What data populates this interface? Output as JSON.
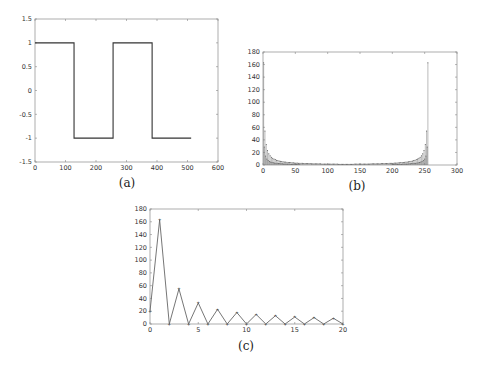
{
  "chart_data": [
    {
      "id": "a",
      "type": "line",
      "caption": "(a)",
      "title": "",
      "xlabel": "",
      "ylabel": "",
      "xlim": [
        0,
        600
      ],
      "ylim": [
        -1.5,
        1.5
      ],
      "xticks": [
        0,
        100,
        200,
        300,
        400,
        500,
        600
      ],
      "yticks": [
        -1.5,
        -1,
        -0.5,
        0,
        0.5,
        1,
        1.5
      ],
      "xtick_labels": [
        "0",
        "100",
        "200",
        "300",
        "400",
        "500",
        "600"
      ],
      "ytick_labels": [
        "-1.5",
        "-1",
        "-0.5",
        "0",
        "0.5",
        "1",
        "1.5"
      ],
      "grid": false,
      "series": [
        {
          "name": "square wave",
          "x": [
            0,
            128,
            128,
            256,
            256,
            384,
            384,
            512
          ],
          "y": [
            1,
            1,
            -1,
            -1,
            1,
            1,
            -1,
            -1
          ]
        }
      ]
    },
    {
      "id": "b",
      "type": "bar",
      "caption": "(b)",
      "title": "",
      "xlabel": "",
      "ylabel": "",
      "xlim": [
        0,
        300
      ],
      "ylim": [
        0,
        180
      ],
      "xticks": [
        0,
        50,
        100,
        150,
        200,
        250,
        300
      ],
      "yticks": [
        0,
        20,
        40,
        60,
        80,
        100,
        120,
        140,
        160,
        180
      ],
      "xtick_labels": [
        "0",
        "50",
        "100",
        "150",
        "200",
        "250",
        "300"
      ],
      "ytick_labels": [
        "0",
        "20",
        "40",
        "60",
        "80",
        "100",
        "120",
        "140",
        "160",
        "180"
      ],
      "grid": false,
      "description": "DFT magnitude spectrum of 256-sample square wave; stems at indices 0-255, large peaks near 0 and 255 (~163), decaying toward the middle (~1-3)",
      "series": [
        {
          "name": "|X[k]|",
          "x": [
            1,
            3,
            5,
            7,
            9,
            11,
            13,
            15,
            20,
            30,
            50,
            100,
            128,
            156,
            206,
            226,
            236,
            241,
            243,
            245,
            247,
            249,
            251,
            253,
            255
          ],
          "values": [
            163,
            55,
            33,
            23,
            18,
            15,
            13,
            11,
            8,
            5.5,
            3,
            1.5,
            1,
            1.5,
            3,
            5.5,
            8,
            11,
            13,
            15,
            18,
            23,
            33,
            55,
            163
          ]
        }
      ]
    },
    {
      "id": "c",
      "type": "line",
      "caption": "(c)",
      "title": "",
      "xlabel": "",
      "ylabel": "",
      "xlim": [
        0,
        20
      ],
      "ylim": [
        0,
        180
      ],
      "xticks": [
        0,
        5,
        10,
        15,
        20
      ],
      "yticks": [
        0,
        20,
        40,
        60,
        80,
        100,
        120,
        140,
        160,
        180
      ],
      "xtick_labels": [
        "0",
        "5",
        "10",
        "15",
        "20"
      ],
      "ytick_labels": [
        "0",
        "20",
        "40",
        "60",
        "80",
        "100",
        "120",
        "140",
        "160",
        "180"
      ],
      "grid": false,
      "series": [
        {
          "name": "|X[k]| zoom",
          "x": [
            0,
            1,
            2,
            3,
            4,
            5,
            6,
            7,
            8,
            9,
            10,
            11,
            12,
            13,
            14,
            15,
            16,
            17,
            18,
            19,
            20
          ],
          "values": [
            20,
            163,
            0,
            55,
            0,
            33,
            0,
            23,
            0,
            18,
            0,
            15,
            0,
            13,
            0,
            11,
            0,
            10,
            0,
            9,
            0
          ]
        }
      ]
    }
  ]
}
